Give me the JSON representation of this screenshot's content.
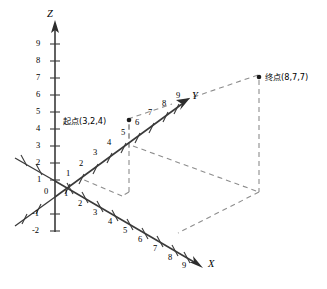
{
  "figure": {
    "type": "3d-coordinate-diagram",
    "background_color": "#ffffff",
    "axis_color": "#3a3a3a",
    "dash_color": "#8d8d8d",
    "point_color": "#1a1a1a"
  },
  "axes": {
    "z": {
      "name": "Z",
      "ticks": [
        "9",
        "8",
        "7",
        "6",
        "5",
        "4",
        "3",
        "2",
        "1",
        "0",
        "-1",
        "-2"
      ]
    },
    "y": {
      "name": "Y",
      "ticks": [
        "1",
        "2",
        "3",
        "4",
        "5",
        "6",
        "7",
        "8",
        "9"
      ]
    },
    "x": {
      "name": "X",
      "ticks": [
        "1",
        "2",
        "3",
        "4",
        "5",
        "6",
        "7",
        "8",
        "9"
      ]
    },
    "origin_label": "0"
  },
  "points": [
    {
      "id": "start",
      "label": "起点(3,2,4)",
      "coords": [
        3,
        2,
        4
      ]
    },
    {
      "id": "end",
      "label": "终点(8,7,7)",
      "coords": [
        8,
        7,
        7
      ]
    }
  ]
}
